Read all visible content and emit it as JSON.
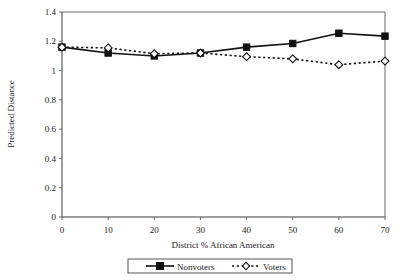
{
  "chart_data": {
    "type": "line",
    "title": "",
    "xlabel": "District % African American",
    "ylabel": "Predicted Distance",
    "x": [
      0,
      10,
      20,
      30,
      40,
      50,
      60,
      70
    ],
    "xtick_labels": [
      "0",
      "10",
      "20",
      "30",
      "40",
      "50",
      "60",
      "70"
    ],
    "ytick_labels": [
      "0",
      "0.2",
      "0.4",
      "0.6",
      "0.8",
      "1",
      "1.2",
      "1.4"
    ],
    "ytick_values": [
      0,
      0.2,
      0.4,
      0.6,
      0.8,
      1.0,
      1.2,
      1.4
    ],
    "xlim": [
      0,
      70
    ],
    "ylim": [
      0,
      1.4
    ],
    "grid": false,
    "legend_position": "bottom-outside",
    "series": [
      {
        "name": "Nonvoters",
        "values": [
          1.16,
          1.12,
          1.1,
          1.12,
          1.16,
          1.185,
          1.255,
          1.235
        ],
        "line_style": "solid",
        "marker": "filled-square",
        "color": "#111111"
      },
      {
        "name": "Voters",
        "values": [
          1.16,
          1.155,
          1.115,
          1.12,
          1.095,
          1.08,
          1.04,
          1.065
        ],
        "line_style": "dashed",
        "marker": "open-diamond",
        "color": "#111111"
      }
    ]
  },
  "legend": {
    "items": [
      {
        "label": "Nonvoters"
      },
      {
        "label": "Voters"
      }
    ]
  },
  "axes": {
    "x_title": "District % African American",
    "y_title": "Predicted Distance"
  }
}
